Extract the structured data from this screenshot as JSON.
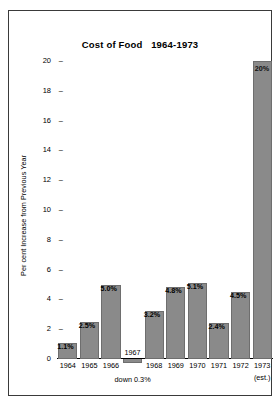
{
  "chart_data": {
    "type": "bar",
    "title": "Cost of Food   1964-1973",
    "xlabel": "",
    "ylabel": "Per cent Increase from Previous Year",
    "categories": [
      "1964",
      "1965",
      "1966",
      "1967",
      "1968",
      "1969",
      "1970",
      "1971",
      "1972",
      "1973"
    ],
    "values": [
      1.1,
      2.5,
      5.0,
      -0.3,
      3.2,
      4.8,
      5.1,
      2.4,
      4.5,
      20.0
    ],
    "data_labels": [
      "1.1%",
      "2.5%",
      "5.0%",
      "1967",
      "3.2%",
      "4.8%",
      "5.1%",
      "2.4%",
      "4.5%",
      "20%"
    ],
    "ylim": [
      0,
      20
    ],
    "yticks": [
      0,
      2,
      4,
      6,
      8,
      10,
      12,
      14,
      16,
      18,
      20
    ],
    "ytick_labels": [
      "0",
      "2",
      "4",
      "6",
      "8",
      "10",
      "12",
      "14",
      "16",
      "18",
      "20"
    ],
    "grid": false,
    "legend": false,
    "annotations": [
      {
        "name": "down-note",
        "text": "down 0.3%",
        "category": "1967"
      },
      {
        "name": "estimate-note",
        "text": "(est.)",
        "category": "1973"
      }
    ],
    "colors": {
      "bar_fill": "#8a8a8a",
      "bar_stroke": "#6e6e6e",
      "axis": "#000000",
      "text": "#000000",
      "background": "#ffffff",
      "frame": "#3a3a3a"
    },
    "tick_dash": "–"
  }
}
